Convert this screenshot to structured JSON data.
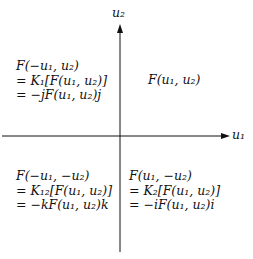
{
  "axes": {
    "horizontal_label": "u₁",
    "vertical_label": "u₂"
  },
  "quadrants": {
    "top_left": [
      "F(−u₁, u₂)",
      "= K₁[F(u₁, u₂)]",
      "= −jF(u₁, u₂)j"
    ],
    "top_right": [
      "F(u₁, u₂)"
    ],
    "bottom_left": [
      "F(−u₁, −u₂)",
      "= K₁₂[F(u₁, u₂)]",
      "= −kF(u₁, u₂)k"
    ],
    "bottom_right": [
      "F(u₁, −u₂)",
      "= K₂[F(u₁, u₂)]",
      "= −iF(u₁, u₂)i"
    ]
  }
}
